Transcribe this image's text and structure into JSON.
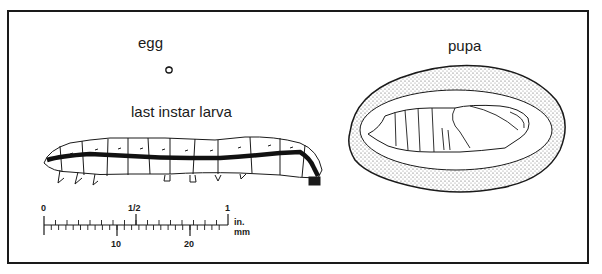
{
  "figure": {
    "labels": {
      "egg": "egg",
      "larva": "last instar larva",
      "pupa": "pupa"
    },
    "scale_bar": {
      "inch_ticks": [
        "0",
        "1/2",
        "1"
      ],
      "inch_unit": "in.",
      "mm_ticks": [
        "10",
        "20"
      ],
      "mm_unit": "mm"
    },
    "colors": {
      "ink": "#1a1a1a",
      "stipple": "#9a9a9a",
      "background": "#ffffff"
    }
  }
}
